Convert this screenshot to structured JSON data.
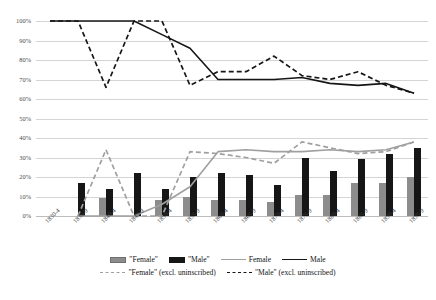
{
  "chart_data": {
    "type": "line",
    "title": "",
    "subtitle": "",
    "xlabel": "",
    "ylabel": "",
    "ylim": [
      0,
      100
    ],
    "y_ticks": [
      "0%",
      "10%",
      "20%",
      "30%",
      "40%",
      "50%",
      "60%",
      "70%",
      "80%",
      "90%",
      "100%"
    ],
    "y_tick_values": [
      0,
      10,
      20,
      30,
      40,
      50,
      60,
      70,
      80,
      90,
      100
    ],
    "grid": true,
    "legend_position": "bottom",
    "categories": [
      "1830-4",
      "1835-9",
      "1840-4",
      "1845-9",
      "1850-4",
      "1855-9",
      "1860-4",
      "1865-9",
      "1870-4",
      "1875-9",
      "1880-4",
      "1885-9",
      "1890-4",
      "1895-9"
    ],
    "series": [
      {
        "name": "\"Female\"",
        "kind": "bar",
        "color": "#8c8c8c",
        "values": [
          0,
          0,
          9,
          0,
          8,
          10,
          8,
          8,
          7,
          11,
          11,
          17,
          17,
          20
        ]
      },
      {
        "name": "\"Male\"",
        "kind": "bar",
        "color": "#161616",
        "values": [
          0,
          17,
          14,
          22,
          14,
          20,
          22,
          21,
          16,
          30,
          23,
          29,
          32,
          35
        ]
      },
      {
        "name": "Female",
        "kind": "line",
        "style": "solid",
        "color": "#a0a0a0",
        "values": [
          null,
          0,
          0,
          0,
          6,
          15,
          33,
          34,
          33,
          33,
          34,
          33,
          34,
          38
        ]
      },
      {
        "name": "Male",
        "kind": "line",
        "style": "solid",
        "color": "#161616",
        "values": [
          100,
          100,
          100,
          100,
          93,
          86,
          70,
          70,
          70,
          71,
          68,
          67,
          68,
          63
        ]
      },
      {
        "name": "\"Female\" (excl. uninscribed)",
        "kind": "line",
        "style": "dashed",
        "color": "#a0a0a0",
        "values": [
          null,
          0,
          34,
          0,
          0,
          33,
          32,
          30,
          27,
          38,
          35,
          32,
          33,
          38
        ]
      },
      {
        "name": "\"Male\" (excl. uninscribed)",
        "kind": "line",
        "style": "dashed",
        "color": "#161616",
        "values": [
          100,
          100,
          66,
          100,
          100,
          67,
          74,
          74,
          82,
          72,
          70,
          74,
          67,
          63
        ]
      }
    ]
  },
  "legend": {
    "row1": [
      {
        "label": "\"Female\"",
        "swatch": "box-female"
      },
      {
        "label": "\"Male\"",
        "swatch": "box-male"
      },
      {
        "label": "Female",
        "swatch": "line-gray"
      },
      {
        "label": "Male",
        "swatch": "line-black"
      }
    ],
    "row2": [
      {
        "label": "\"Female\" (excl. uninscribed)",
        "swatch": "dash-gray"
      },
      {
        "label": "\"Male\" (excl. uninscribed)",
        "swatch": "dash-black"
      }
    ]
  }
}
